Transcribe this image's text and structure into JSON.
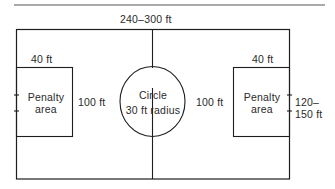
{
  "diagram": {
    "colors": {
      "line": "#1e1e1e",
      "text": "#2a2a2a",
      "background": "#ffffff",
      "rule": "#555555"
    },
    "labels": {
      "field_length": "240–300 ft",
      "field_width_line1": "120–",
      "field_width_line2": "150 ft",
      "left_penalty_depth": "40 ft",
      "right_penalty_depth": "40 ft",
      "left_penalty_width": "100 ft",
      "right_penalty_width": "100 ft",
      "left_penalty_name_line1": "Penalty",
      "left_penalty_name_line2": "area",
      "right_penalty_name_line1": "Penalty",
      "right_penalty_name_line2": "area",
      "circle_line1": "Circle",
      "circle_line2": "30 ft radius"
    }
  }
}
